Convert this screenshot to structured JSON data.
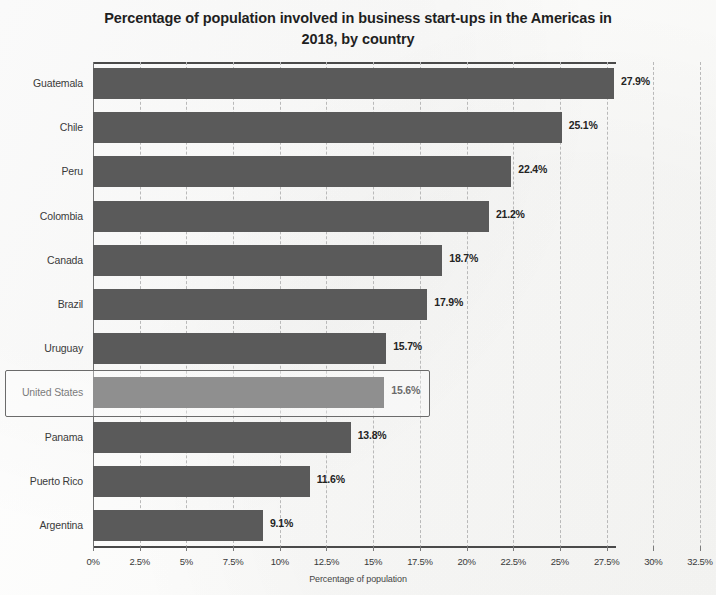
{
  "chart_data": {
    "type": "bar",
    "orientation": "horizontal",
    "title": "Percentage of population involved in business start-ups in the Americas in 2018, by country",
    "title_line1": "Percentage of population involved in business start-ups in the Americas in",
    "title_line2": "2018, by country",
    "xlabel": "Percentage of population",
    "ylabel": "",
    "xlim": [
      0,
      32.5
    ],
    "grid": true,
    "legend": false,
    "categories": [
      "Guatemala",
      "Chile",
      "Peru",
      "Colombia",
      "Canada",
      "Brazil",
      "Uruguay",
      "United States",
      "Panama",
      "Puerto Rico",
      "Argentina"
    ],
    "values": [
      27.9,
      25.1,
      22.4,
      21.2,
      18.7,
      17.9,
      15.7,
      15.6,
      13.8,
      11.6,
      9.1
    ],
    "value_labels": [
      "27.9%",
      "25.1%",
      "22.4%",
      "21.2%",
      "18.7%",
      "17.9%",
      "15.7%",
      "15.6%",
      "13.8%",
      "11.6%",
      "9.1%"
    ],
    "xticks": [
      0,
      2.5,
      5,
      7.5,
      10,
      12.5,
      15,
      17.5,
      20,
      22.5,
      25,
      27.5,
      30,
      32.5
    ],
    "xtick_labels": [
      "0%",
      "2.5%",
      "5%",
      "7.5%",
      "10%",
      "12.5%",
      "15%",
      "17.5%",
      "20%",
      "22.5%",
      "25%",
      "27.5%",
      "30%",
      "32.5%"
    ],
    "highlighted_category": "United States",
    "bar_color": "#5a5a5a",
    "gridline_color": "#b9b9b9",
    "axis_color": "#4a4a4a",
    "highlight_border_color": "#6b6b6b"
  }
}
